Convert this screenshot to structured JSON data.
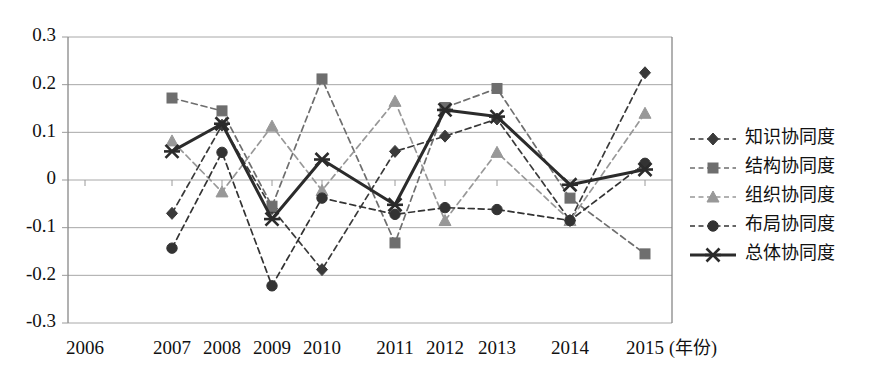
{
  "chart_data": {
    "type": "line",
    "title": "",
    "xlabel": "(年份)",
    "ylabel": "",
    "x": [
      2006,
      2007,
      2008,
      2009,
      2010,
      2011,
      2012,
      2013,
      2014,
      2015
    ],
    "xticklabels": [
      "2006",
      "2007",
      "2008",
      "2009",
      "2010",
      "2011",
      "2012",
      "2013",
      "2014",
      "2015"
    ],
    "yticklabels": [
      "0.3",
      "0.2",
      "0.1",
      "0",
      "-0.1",
      "-0.2",
      "-0.3"
    ],
    "ytickvalues": [
      0.3,
      0.2,
      0.1,
      0,
      -0.1,
      -0.2,
      -0.3
    ],
    "ylim": [
      -0.3,
      0.3
    ],
    "grid": true,
    "legend_position": "right",
    "series": [
      {
        "name": "知识协同度",
        "marker": "diamond",
        "linestyle": "dashed",
        "color": "#3a3a3a",
        "values": [
          null,
          -0.07,
          0.115,
          -0.06,
          -0.188,
          0.06,
          0.092,
          0.128,
          -0.085,
          0.225
        ]
      },
      {
        "name": "结构协同度",
        "marker": "square",
        "linestyle": "dashed",
        "color": "#6e6e6e",
        "values": [
          null,
          0.172,
          0.145,
          -0.055,
          0.212,
          -0.132,
          0.152,
          0.192,
          -0.038,
          -0.155
        ]
      },
      {
        "name": "组织协同度",
        "marker": "triangle",
        "linestyle": "dashed",
        "color": "#989898",
        "values": [
          null,
          0.082,
          -0.025,
          0.113,
          -0.022,
          0.165,
          -0.085,
          0.058,
          -0.085,
          0.14
        ]
      },
      {
        "name": "布局协同度",
        "marker": "circle",
        "linestyle": "dashed",
        "color": "#333333",
        "values": [
          null,
          -0.143,
          0.058,
          -0.222,
          -0.038,
          -0.072,
          -0.058,
          -0.062,
          -0.085,
          0.035
        ]
      },
      {
        "name": "总体协同度",
        "marker": "cross",
        "linestyle": "solid",
        "color": "#2b2b2b",
        "values": [
          null,
          0.06,
          0.118,
          -0.082,
          0.043,
          -0.052,
          0.147,
          0.133,
          -0.01,
          0.022
        ]
      }
    ]
  },
  "legend": {
    "entries": [
      {
        "label": "知识协同度"
      },
      {
        "label": "结构协同度"
      },
      {
        "label": "组织协同度"
      },
      {
        "label": "布局协同度"
      },
      {
        "label": "总体协同度"
      }
    ]
  },
  "colors": {
    "gridline": "#a8a8a8",
    "axis": "#7d7d7d",
    "background": "#ffffff"
  }
}
